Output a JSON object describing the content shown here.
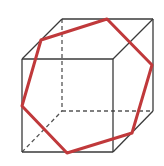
{
  "diagram": {
    "caption_fragment": "· · · · ·",
    "colors": {
      "edge": "#3a3a3a",
      "hidden_edge": "#555555",
      "section": "#c0393b",
      "background": "#ffffff"
    },
    "cube": {
      "front_face": [
        [
          22,
          59
        ],
        [
          113,
          59
        ],
        [
          113,
          152
        ],
        [
          22,
          152
        ]
      ],
      "back_face": [
        [
          62,
          19
        ],
        [
          153,
          19
        ],
        [
          153,
          111
        ],
        [
          62,
          111
        ]
      ],
      "visible_edges": [
        [
          [
            22,
            59
          ],
          [
            113,
            59
          ]
        ],
        [
          [
            113,
            59
          ],
          [
            113,
            152
          ]
        ],
        [
          [
            113,
            152
          ],
          [
            22,
            152
          ]
        ],
        [
          [
            22,
            152
          ],
          [
            22,
            59
          ]
        ],
        [
          [
            62,
            19
          ],
          [
            153,
            19
          ]
        ],
        [
          [
            153,
            19
          ],
          [
            153,
            111
          ]
        ],
        [
          [
            22,
            59
          ],
          [
            62,
            19
          ]
        ],
        [
          [
            113,
            59
          ],
          [
            153,
            19
          ]
        ],
        [
          [
            113,
            152
          ],
          [
            153,
            111
          ]
        ]
      ],
      "hidden_edges": [
        [
          [
            62,
            19
          ],
          [
            62,
            111
          ]
        ],
        [
          [
            62,
            111
          ],
          [
            153,
            111
          ]
        ],
        [
          [
            22,
            152
          ],
          [
            62,
            111
          ]
        ]
      ]
    },
    "section_hexagon": [
      [
        41,
        40
      ],
      [
        107,
        19
      ],
      [
        152,
        65
      ],
      [
        132,
        133
      ],
      [
        67,
        153
      ],
      [
        22,
        106
      ]
    ]
  }
}
